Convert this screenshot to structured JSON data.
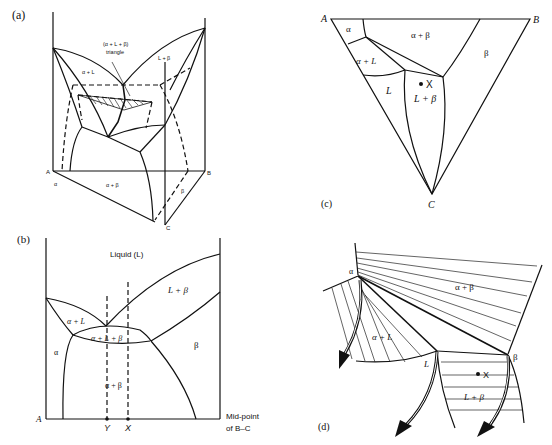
{
  "figure": {
    "panels": [
      {
        "id": "a",
        "label": "(a)",
        "type": "3d-ternary-eutectic-space-model",
        "corners": {
          "A": "A",
          "B": "B",
          "C": "C"
        },
        "region_labels": {
          "alpha_L": "α + L",
          "L_beta": "L + β",
          "alpha_beta": "α + β",
          "alpha": "α",
          "beta": "β",
          "triangle_line1": "(α + L + β)",
          "triangle_line2": "triangle"
        }
      },
      {
        "id": "b",
        "label": "(b)",
        "type": "vertical-section",
        "region_labels": {
          "liquid": "Liquid (L)",
          "L_beta": "L + β",
          "alpha_L": "α + L",
          "alpha_L_beta": "α + L + β",
          "alpha": "α",
          "beta": "β",
          "alpha_beta": "α + β"
        },
        "axis": {
          "left": "A",
          "right_line1": "Mid-point",
          "right_line2": "of B–C",
          "markers": [
            "Y",
            "X"
          ]
        }
      },
      {
        "id": "c",
        "label": "(c)",
        "type": "isothermal-section",
        "corners": {
          "A": "A",
          "B": "B",
          "C": "C"
        },
        "region_labels": {
          "alpha": "α",
          "alpha_beta": "α + β",
          "beta": "β",
          "alpha_L": "α + L",
          "L": "L",
          "L_beta": "L + β",
          "point": "X"
        }
      },
      {
        "id": "d",
        "label": "(d)",
        "type": "tie-triangle-detail",
        "region_labels": {
          "alpha_vertex": "α",
          "alpha_beta": "α + β",
          "alpha_L": "α + L",
          "L_vertex": "L",
          "beta_vertex": "β",
          "L_beta": "L + β",
          "point": "X"
        }
      }
    ]
  }
}
